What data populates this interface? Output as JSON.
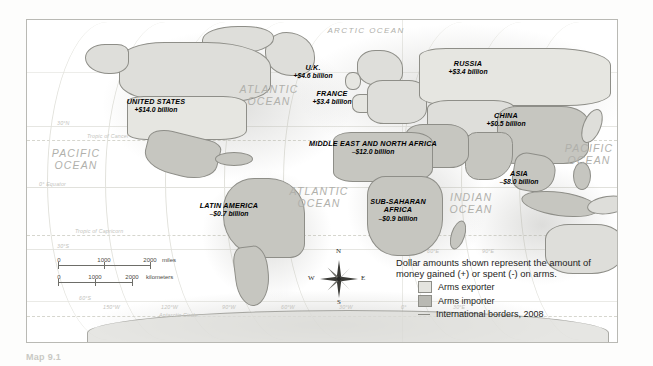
{
  "map": {
    "title_caption": "Map 9.1",
    "regions": [
      {
        "name": "UNITED STATES",
        "value": "+$14.0 billion",
        "x": 155,
        "y": 92
      },
      {
        "name": "U.K.",
        "value": "+$4.6 billion",
        "x": 312,
        "y": 58
      },
      {
        "name": "FRANCE",
        "value": "+$3.4 billion",
        "x": 331,
        "y": 84
      },
      {
        "name": "RUSSIA",
        "value": "+$3.4 billion",
        "x": 467,
        "y": 54
      },
      {
        "name": "CHINA",
        "value": "+$0.5 billion",
        "x": 505,
        "y": 106
      },
      {
        "name": "MIDDLE EAST AND NORTH AFRICA",
        "value": "–$12.0 billion",
        "x": 372,
        "y": 134
      },
      {
        "name": "ASIA",
        "value": "–$8.0 billion",
        "x": 518,
        "y": 164
      },
      {
        "name": "LATIN AMERICA",
        "value": "–$0.7 billion",
        "x": 228,
        "y": 196
      },
      {
        "name": "SUB-SAHARAN AFRICA",
        "value": "–$0.9 billion",
        "x": 397,
        "y": 197,
        "twoline": true
      }
    ],
    "oceans": [
      {
        "label": "ARCTIC OCEAN",
        "x": 365,
        "y": 24,
        "size": "small"
      },
      {
        "label": "ATLANTIC OCEAN",
        "x": 268,
        "y": 88,
        "size": "big"
      },
      {
        "label": "PACIFIC OCEAN",
        "x": 75,
        "y": 152,
        "size": "big"
      },
      {
        "label": "ATLANTIC OCEAN",
        "x": 318,
        "y": 190,
        "size": "big"
      },
      {
        "label": "INDIAN OCEAN",
        "x": 470,
        "y": 196,
        "size": "big"
      },
      {
        "label": "PACIFIC OCEAN",
        "x": 588,
        "y": 147,
        "size": "big"
      }
    ],
    "grid_labels": [
      {
        "text": "30°N",
        "x": 30,
        "y": 125
      },
      {
        "text": "Tropic of Cancer",
        "x": 66,
        "y": 138
      },
      {
        "text": "0° Equator",
        "x": 26,
        "y": 186
      },
      {
        "text": "30°S",
        "x": 30,
        "y": 248
      },
      {
        "text": "Tropic of Capricorn",
        "x": 60,
        "y": 236
      },
      {
        "text": "60°S",
        "x": 63,
        "y": 300
      },
      {
        "text": "Antarctic Circle",
        "x": 160,
        "y": 318
      },
      {
        "text": "150°W",
        "x": 105,
        "y": 310
      },
      {
        "text": "120°W",
        "x": 163,
        "y": 310
      },
      {
        "text": "90°W",
        "x": 224,
        "y": 310
      },
      {
        "text": "60°W",
        "x": 282,
        "y": 310
      },
      {
        "text": "30°W",
        "x": 340,
        "y": 310
      },
      {
        "text": "0°",
        "x": 400,
        "y": 310
      },
      {
        "text": "30°E",
        "x": 452,
        "y": 310
      },
      {
        "text": "60°E",
        "x": 420,
        "y": 246
      },
      {
        "text": "90°E",
        "x": 470,
        "y": 246
      },
      {
        "text": "60°E",
        "x": 430,
        "y": 253
      },
      {
        "text": "90°E",
        "x": 483,
        "y": 253
      }
    ]
  },
  "scalebar": {
    "miles": {
      "ticks": [
        "0",
        "1000",
        "2000"
      ],
      "unit": "miles"
    },
    "kilometers": {
      "ticks": [
        "0",
        "1000",
        "2000"
      ],
      "unit": "kilometers"
    }
  },
  "compass": {
    "north": "N",
    "east": "E",
    "south": "S",
    "west": "W"
  },
  "legend": {
    "description": "Dollar amounts shown represent the amount of money gained (+) or spent (-) on arms.",
    "items": [
      {
        "label": "Arms exporter",
        "swatch": "exporter"
      },
      {
        "label": "Arms importer",
        "swatch": "importer"
      },
      {
        "label": "International borders, 2008",
        "swatch": "line"
      }
    ]
  },
  "colors": {
    "exporter": "#e4e4df",
    "importer": "#b9b9b3",
    "border": "#8b8b85",
    "graticule": "#dcdcd6",
    "ocean_text": "#b0b0ab"
  }
}
